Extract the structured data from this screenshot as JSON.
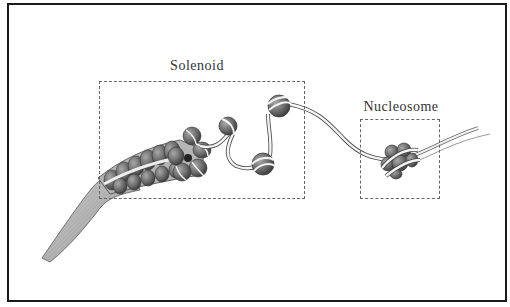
{
  "figure": {
    "labels": {
      "solenoid": "Solenoid",
      "nucleosome": "Nucleosome"
    },
    "colors": {
      "frame_border": "#1a1a1a",
      "dashed_box": "#666666",
      "bead_fill": "#6e6e6e",
      "dna_strand": "#f4f4f4",
      "outline": "#333333"
    }
  }
}
